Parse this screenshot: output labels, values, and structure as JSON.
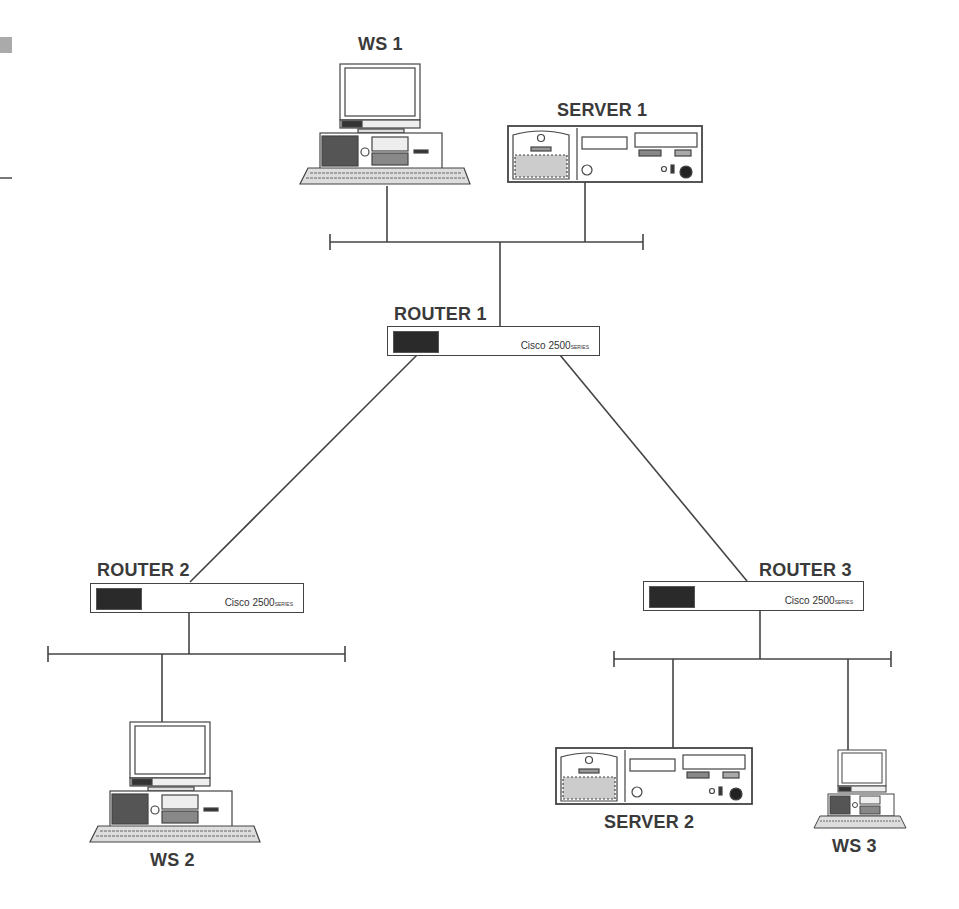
{
  "diagram": {
    "type": "network-topology",
    "colors": {
      "line": "#444444",
      "label": "#3a3a3a",
      "logo_bg": "#2a2a2a",
      "background": "#ffffff"
    },
    "nodes": {
      "ws1": {
        "label": "WS 1",
        "kind": "workstation"
      },
      "server1": {
        "label": "SERVER 1",
        "kind": "server"
      },
      "router1": {
        "label": "ROUTER 1",
        "kind": "router",
        "model": "Cisco 2500",
        "model_suffix": "SERIES"
      },
      "router2": {
        "label": "ROUTER 2",
        "kind": "router",
        "model": "Cisco 2500",
        "model_suffix": "SERIES"
      },
      "router3": {
        "label": "ROUTER 3",
        "kind": "router",
        "model": "Cisco 2500",
        "model_suffix": "SERIES"
      },
      "ws2": {
        "label": "WS 2",
        "kind": "workstation"
      },
      "server2": {
        "label": "SERVER  2",
        "kind": "server"
      },
      "ws3": {
        "label": "WS 3",
        "kind": "workstation"
      }
    },
    "links": [
      {
        "from": "ws1",
        "to": "lan1"
      },
      {
        "from": "server1",
        "to": "lan1"
      },
      {
        "from": "lan1",
        "to": "router1"
      },
      {
        "from": "router1",
        "to": "router2"
      },
      {
        "from": "router1",
        "to": "router3"
      },
      {
        "from": "router2",
        "to": "lan2"
      },
      {
        "from": "lan2",
        "to": "ws2"
      },
      {
        "from": "router3",
        "to": "lan3"
      },
      {
        "from": "lan3",
        "to": "server2"
      },
      {
        "from": "lan3",
        "to": "ws3"
      }
    ]
  }
}
